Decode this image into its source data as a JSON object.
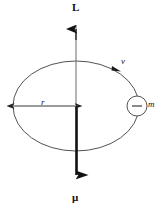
{
  "figure": {
    "background_color": "#ffffff",
    "stroke_color": "#3a3a3a",
    "bold_stroke_color": "#111111",
    "labels": {
      "angular_momentum": "L",
      "magnetic_moment": "μ",
      "velocity": "v",
      "mass": "m",
      "radius": "r",
      "charge_sign": "−"
    },
    "geometry": {
      "ellipse_center_x": 76,
      "ellipse_center_y": 106,
      "ellipse_rx": 63,
      "ellipse_ry": 45,
      "axis_top_y": 18,
      "axis_bottom_y": 188,
      "particle_circle_x": 137,
      "particle_circle_y": 106,
      "particle_circle_r": 10,
      "radius_arrow_from_x": 13,
      "radius_arrow_to_x": 75,
      "radius_arrow_y": 106
    }
  }
}
